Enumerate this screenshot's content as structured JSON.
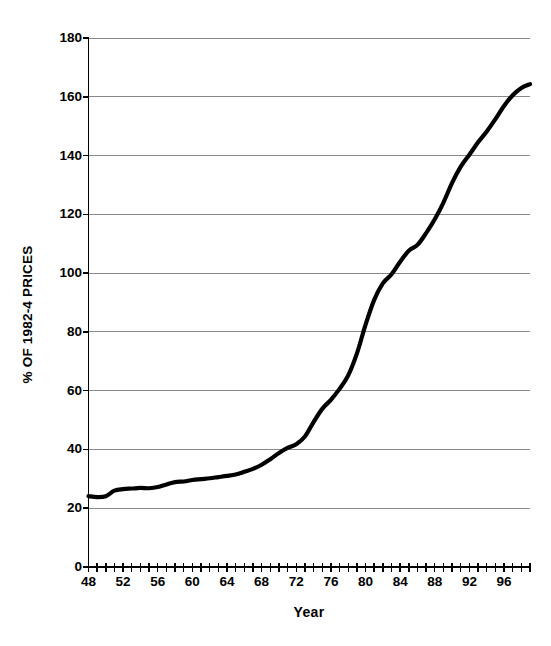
{
  "chart_data": {
    "type": "line",
    "title": "",
    "xlabel": "Year",
    "ylabel": "% OF 1982-4 PRICES",
    "xlim": [
      48,
      99
    ],
    "ylim": [
      0,
      180
    ],
    "ytick_step": 20,
    "xtick_step": 1,
    "xlabel_step": 4,
    "grid": "horizontal",
    "legend": "none",
    "line_color": "#000000",
    "grid_color": "#8a8a8a",
    "axis_color": "#000000",
    "yticks": [
      0,
      20,
      40,
      60,
      80,
      100,
      120,
      140,
      160,
      180
    ],
    "ytick_labels": [
      "0",
      "20",
      "40",
      "60",
      "80",
      "100",
      "120",
      "140",
      "160",
      "180"
    ],
    "xticks": [
      48,
      49,
      50,
      51,
      52,
      53,
      54,
      55,
      56,
      57,
      58,
      59,
      60,
      61,
      62,
      63,
      64,
      65,
      66,
      67,
      68,
      69,
      70,
      71,
      72,
      73,
      74,
      75,
      76,
      77,
      78,
      79,
      80,
      81,
      82,
      83,
      84,
      85,
      86,
      87,
      88,
      89,
      90,
      91,
      92,
      93,
      94,
      95,
      96,
      97,
      98,
      99
    ],
    "xtick_labels_shown": [
      "48",
      "52",
      "56",
      "60",
      "64",
      "68",
      "72",
      "76",
      "80",
      "84",
      "88",
      "92",
      "96"
    ],
    "xtick_label_values": [
      48,
      52,
      56,
      60,
      64,
      68,
      72,
      76,
      80,
      84,
      88,
      92,
      96
    ],
    "series": [
      {
        "name": "Consumer Price Index",
        "x": [
          48,
          49,
          50,
          51,
          52,
          53,
          54,
          55,
          56,
          57,
          58,
          59,
          60,
          61,
          62,
          63,
          64,
          65,
          66,
          67,
          68,
          69,
          70,
          71,
          72,
          73,
          74,
          75,
          76,
          77,
          78,
          79,
          80,
          81,
          82,
          83,
          84,
          85,
          86,
          87,
          88,
          89,
          90,
          91,
          92,
          93,
          94,
          95,
          96,
          97,
          98,
          99
        ],
        "values": [
          24.1,
          23.8,
          24.1,
          26.0,
          26.5,
          26.7,
          26.9,
          26.8,
          27.2,
          28.1,
          28.9,
          29.1,
          29.6,
          29.9,
          30.2,
          30.6,
          31.0,
          31.5,
          32.4,
          33.4,
          34.8,
          36.7,
          38.8,
          40.5,
          41.8,
          44.4,
          49.3,
          53.8,
          56.9,
          60.6,
          65.2,
          72.6,
          82.4,
          90.9,
          96.5,
          99.6,
          103.9,
          107.6,
          109.6,
          113.6,
          118.3,
          124.0,
          130.7,
          136.2,
          140.3,
          144.5,
          148.2,
          152.4,
          156.9,
          160.5,
          163.0,
          164.3
        ]
      }
    ]
  },
  "axes": {
    "y_title": "% OF 1982-4 PRICES",
    "x_title": "Year"
  }
}
